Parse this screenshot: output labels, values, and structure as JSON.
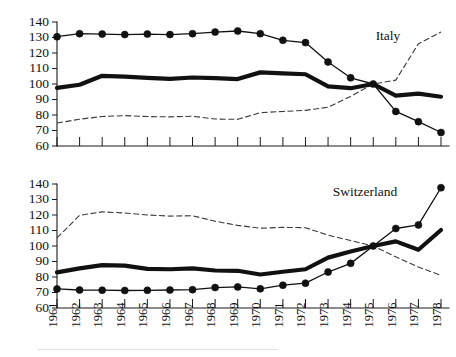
{
  "figure": {
    "background": "#ffffff",
    "ink_color": "#111111",
    "width": 456,
    "height": 357
  },
  "footer": {
    "rule_visible": true
  },
  "chart_data": [
    {
      "type": "line",
      "title": "Italy",
      "panel": "top",
      "xlabel": "",
      "ylabel": "",
      "x": [
        1961,
        1962,
        1963,
        1964,
        1965,
        1966,
        1967,
        1968,
        1969,
        1970,
        1971,
        1972,
        1973,
        1974,
        1975,
        1976,
        1977,
        1978
      ],
      "categories": [
        "1961",
        "1962",
        "1963",
        "1964",
        "1965",
        "1966",
        "1967",
        "1968",
        "1969",
        "1970",
        "1971",
        "1972",
        "1973",
        "1974",
        "1975",
        "1976",
        "1977",
        "1978"
      ],
      "ylim": [
        60,
        140
      ],
      "yticks": [
        60,
        70,
        80,
        90,
        100,
        110,
        120,
        130,
        140
      ],
      "xticks_shown": false,
      "xtick_labels_shown": false,
      "grid": false,
      "legend": "none",
      "annotations": [
        {
          "text": "Italy",
          "x": 1976.0,
          "y": 134,
          "name": "panel-label-italy"
        }
      ],
      "series": [
        {
          "name": "marker-series",
          "style": "solid-with-round-markers",
          "markers": true,
          "values": [
            130.5,
            132.5,
            132.2,
            131.9,
            132.2,
            131.9,
            132.5,
            133.5,
            134.2,
            132.5,
            128.2,
            126.7,
            114.2,
            104.0,
            100.0,
            82.3,
            75.7,
            68.7
          ]
        },
        {
          "name": "thick-series",
          "style": "thick-solid",
          "markers": false,
          "values": [
            97.5,
            99.5,
            105.3,
            104.7,
            104.0,
            103.3,
            104.2,
            103.8,
            103.2,
            107.5,
            106.8,
            106.3,
            98.5,
            97.3,
            100.0,
            92.5,
            93.8,
            91.8
          ]
        },
        {
          "name": "dashed-series",
          "style": "dashed-thin",
          "markers": false,
          "values": [
            74.8,
            77.3,
            79.0,
            79.6,
            79.0,
            78.8,
            79.2,
            77.4,
            77.2,
            81.5,
            82.3,
            83.0,
            85.0,
            92.0,
            100.0,
            102.5,
            126.0,
            133.5
          ]
        }
      ]
    },
    {
      "type": "line",
      "title": "Switzerland",
      "panel": "bottom",
      "xlabel": "",
      "ylabel": "",
      "x": [
        1961,
        1962,
        1963,
        1964,
        1965,
        1966,
        1967,
        1968,
        1969,
        1970,
        1971,
        1972,
        1973,
        1974,
        1975,
        1976,
        1977,
        1978
      ],
      "categories": [
        "1961",
        "1962",
        "1963",
        "1964",
        "1965",
        "1966",
        "1967",
        "1968",
        "1969",
        "1970",
        "1971",
        "1972",
        "1973",
        "1974",
        "1975",
        "1976",
        "1977",
        "1978"
      ],
      "ylim": [
        60,
        140
      ],
      "yticks": [
        60,
        70,
        80,
        90,
        100,
        110,
        120,
        130,
        140
      ],
      "xticks_shown": true,
      "xtick_labels_shown": true,
      "xtick_label_rotation": -90,
      "grid": false,
      "legend": "none",
      "annotations": [
        {
          "text": "Switzerland",
          "x": 1974.6,
          "y": 130,
          "name": "panel-label-switzerland"
        }
      ],
      "series": [
        {
          "name": "marker-series",
          "style": "solid-with-round-markers",
          "markers": true,
          "values": [
            72.3,
            71.6,
            71.5,
            71.3,
            71.4,
            71.6,
            71.8,
            73.2,
            73.6,
            72.4,
            74.7,
            76.0,
            83.2,
            88.8,
            100.0,
            111.3,
            113.6,
            137.6
          ]
        },
        {
          "name": "thick-series",
          "style": "thick-solid",
          "markers": false,
          "values": [
            83.0,
            85.6,
            87.7,
            87.3,
            85.2,
            85.0,
            85.6,
            84.2,
            84.0,
            81.6,
            83.4,
            85.0,
            92.5,
            96.4,
            100.0,
            103.0,
            97.6,
            110.3
          ]
        },
        {
          "name": "dashed-series",
          "style": "dashed-thin",
          "markers": false,
          "values": [
            105.2,
            119.8,
            122.0,
            121.3,
            120.0,
            119.3,
            119.5,
            116.0,
            113.3,
            111.5,
            112.0,
            111.8,
            107.0,
            103.5,
            100.0,
            93.0,
            86.5,
            81.0
          ]
        }
      ]
    }
  ]
}
